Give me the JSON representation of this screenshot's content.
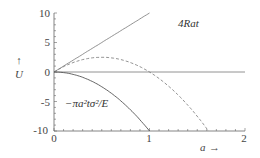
{
  "chart_data": {
    "type": "line",
    "title": "",
    "xlabel": "a →",
    "ylabel": "↑ U",
    "xlim": [
      0,
      2
    ],
    "ylim": [
      -10,
      10
    ],
    "x_ticks": [
      "0",
      "1",
      "2"
    ],
    "y_ticks": [
      "10",
      "5",
      "0",
      "-5",
      "-10"
    ],
    "grid": false,
    "legend": null,
    "annotations": [
      {
        "text": "4Rat",
        "x": 1.45,
        "y": 8.9
      },
      {
        "text": "−πa²tσ²/E",
        "x": 0.18,
        "y": -5.8
      }
    ],
    "series": [
      {
        "name": "4Rat",
        "style": "solid",
        "x": [
          0,
          0.5,
          1.0
        ],
        "values": [
          0,
          5,
          10
        ]
      },
      {
        "name": "total",
        "style": "dashed",
        "x": [
          0,
          0.25,
          0.5,
          0.75,
          1.0,
          1.25,
          1.5,
          1.6
        ],
        "values": [
          0,
          1.9,
          2.5,
          1.9,
          0,
          -3.1,
          -7.5,
          -9.6
        ]
      },
      {
        "name": "-πa²tσ²/E",
        "style": "solid",
        "x": [
          0,
          0.25,
          0.5,
          0.75,
          1.0
        ],
        "values": [
          0,
          -0.6,
          -2.5,
          -5.6,
          -10
        ]
      },
      {
        "name": "zero",
        "style": "solid",
        "x": [
          0,
          2
        ],
        "values": [
          0,
          0
        ]
      }
    ]
  },
  "labels": {
    "y_arrow": "↑",
    "y_var": "U",
    "x_var": "a",
    "x_arrow": "→",
    "anno_line": "4Rat",
    "anno_parabola": "−πa²tσ²/E",
    "ticks": {
      "y10": "10",
      "y5": "5",
      "y0": "0",
      "ym5": "-5",
      "ym10": "-10",
      "x0": "0",
      "x1": "1",
      "x2": "2"
    }
  }
}
